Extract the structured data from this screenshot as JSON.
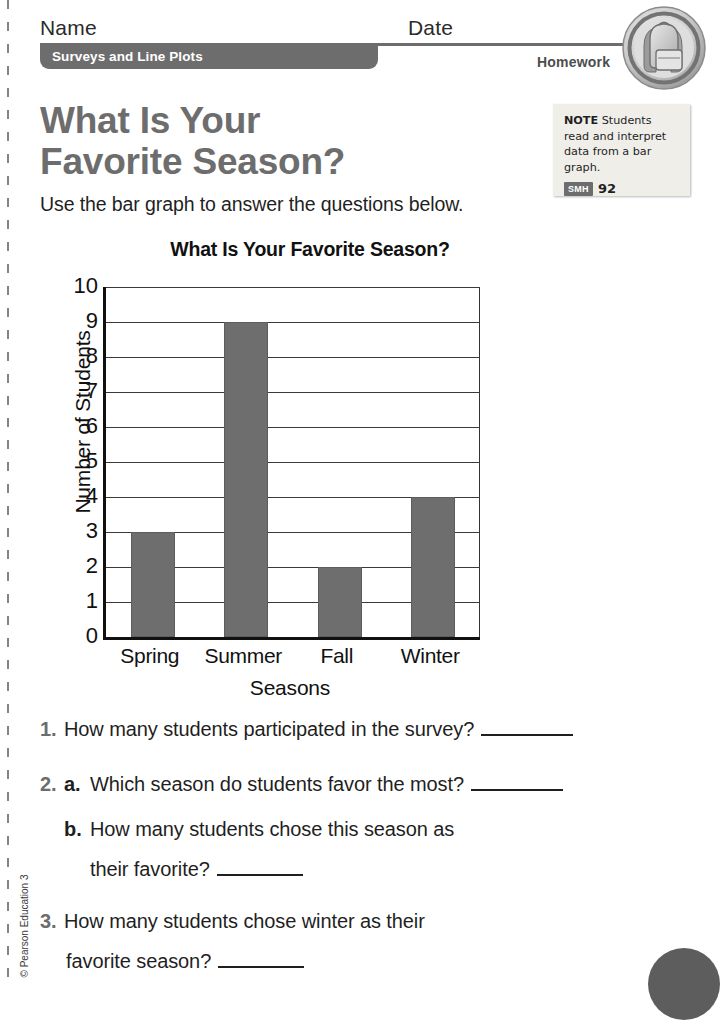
{
  "header": {
    "name_label": "Name",
    "date_label": "Date",
    "lesson_chip": "Surveys and Line Plots",
    "assignment_type": "Homework",
    "badge_icon": "backpack-icon"
  },
  "note": {
    "keyword": "NOTE",
    "text": "Students read and interpret data from a bar graph.",
    "smh_chip": "SMH",
    "smh_page": "92"
  },
  "title": {
    "line1": "What Is Your",
    "line2": "Favorite Season?",
    "instruction": "Use the bar graph to answer the questions below."
  },
  "chart_data": {
    "type": "bar",
    "title": "What Is Your Favorite Season?",
    "categories": [
      "Spring",
      "Summer",
      "Fall",
      "Winter"
    ],
    "values": [
      3,
      9,
      2,
      4
    ],
    "xlabel": "Seasons",
    "ylabel": "Number of Students",
    "ylim": [
      0,
      10
    ],
    "ytick_step": 1,
    "yticks": [
      "10",
      "9",
      "8",
      "7",
      "6",
      "5",
      "4",
      "3",
      "2",
      "1",
      "0"
    ],
    "grid": true,
    "legend": "none",
    "bar_color": "#6e6e6e",
    "axis_color": "#111111"
  },
  "questions": [
    {
      "number": "1.",
      "sub": "",
      "text": "How many students participated in the survey?",
      "has_blank": true
    },
    {
      "number": "2.",
      "sub": "a.",
      "text": "Which season do students favor the most?",
      "has_blank": true
    },
    {
      "number": "",
      "sub": "b.",
      "text": "How many students chose this season as",
      "has_blank": false
    },
    {
      "number": "",
      "sub": "",
      "text": "their favorite?",
      "has_blank": true
    },
    {
      "number": "3.",
      "sub": "",
      "text": "How many students chose winter as their",
      "has_blank": false
    },
    {
      "number": "",
      "sub": "",
      "text": "favorite season?",
      "has_blank": true
    }
  ],
  "footer": {
    "copyright": "© Pearson Education 3"
  }
}
